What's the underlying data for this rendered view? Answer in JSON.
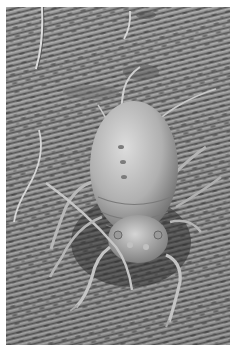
{
  "image": {
    "description": "Scanning electron micrograph of an aphid standing on a leaf surface with striated texture",
    "palette": {
      "background": "#ffffff",
      "surface_mid": "#8a8a8a",
      "surface_light": "#b4b4b4",
      "surface_dark": "#4a4a4a",
      "body_light": "#d0d0d0",
      "body_mid": "#a6a6a6",
      "shadow": "#3a3a3a"
    },
    "subject": "aphid",
    "setting": "leaf surface"
  }
}
